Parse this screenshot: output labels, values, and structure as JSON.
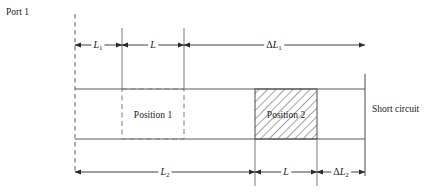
{
  "diagram": {
    "type": "engineering-schematic",
    "colors": {
      "line": "#4d4d4d",
      "text": "#1a1a1a",
      "hatch": "#555555",
      "background": "#ffffff"
    },
    "labels": {
      "port": "Port 1",
      "short_circuit": "Short circuit",
      "position_1": "Position 1",
      "position_2": "Position 2"
    },
    "dimensions": {
      "top": [
        {
          "id": "L1",
          "base": "L",
          "sub": "1",
          "delta": false,
          "from_x": 75,
          "to_x": 122
        },
        {
          "id": "L",
          "base": "L",
          "sub": "",
          "delta": false,
          "from_x": 122,
          "to_x": 184
        },
        {
          "id": "dL1",
          "base": "L",
          "sub": "1",
          "delta": true,
          "from_x": 184,
          "to_x": 365
        }
      ],
      "bottom": [
        {
          "id": "L2",
          "base": "L",
          "sub": "2",
          "delta": false,
          "from_x": 75,
          "to_x": 255
        },
        {
          "id": "L",
          "base": "L",
          "sub": "",
          "delta": false,
          "from_x": 255,
          "to_x": 317
        },
        {
          "id": "dL2",
          "base": "L",
          "sub": "2",
          "delta": true,
          "from_x": 317,
          "to_x": 365
        }
      ]
    },
    "geometry": {
      "port_line_x": 75,
      "short_circuit_x": 365,
      "guide_top_y": 89,
      "guide_bottom_y": 139,
      "top_dim_y": 45,
      "bottom_dim_y": 172,
      "position_1": {
        "x": 122,
        "width": 62
      },
      "position_2": {
        "x": 255,
        "width": 62
      }
    }
  }
}
